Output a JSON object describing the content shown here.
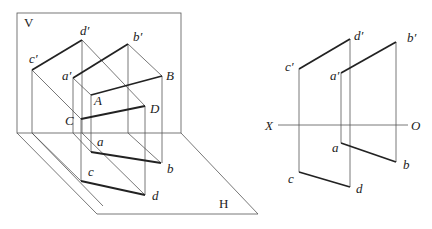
{
  "diagram": {
    "type": "orthographic-projection",
    "left_view": {
      "plane_labels": {
        "V": "V",
        "H": "H"
      },
      "points": {
        "c_prime": "c′",
        "d_prime": "d′",
        "a_prime": "a′",
        "b_prime": "b′",
        "A": "A",
        "B": "B",
        "C": "C",
        "D": "D",
        "a": "a",
        "b": "b",
        "c": "c",
        "d": "d"
      }
    },
    "right_view": {
      "axis": {
        "X": "X",
        "O": "O"
      },
      "points": {
        "c_prime": "c′",
        "d_prime": "d′",
        "a_prime": "a′",
        "b_prime": "b′",
        "a": "a",
        "b": "b",
        "c": "c",
        "d": "d"
      }
    }
  }
}
